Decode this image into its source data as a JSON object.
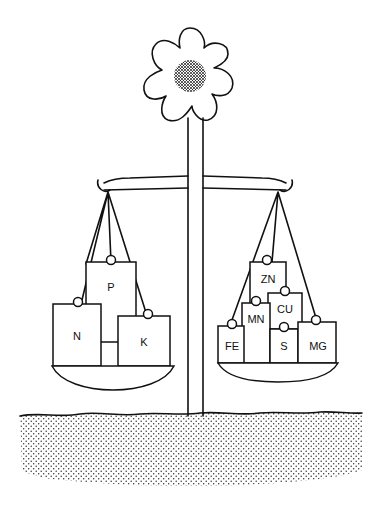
{
  "figure": {
    "colors": {
      "ink": "#111111",
      "paper": "#ffffff",
      "soil_dots": "#333333"
    },
    "left_pan": {
      "group": "macronutrients",
      "blocks": [
        {
          "label": "N"
        },
        {
          "label": "P"
        },
        {
          "label": "K"
        }
      ]
    },
    "right_pan": {
      "group": "micronutrients",
      "blocks": [
        {
          "label": "ZN"
        },
        {
          "label": "MN"
        },
        {
          "label": "CU"
        },
        {
          "label": "FE"
        },
        {
          "label": "S"
        },
        {
          "label": "MG"
        }
      ]
    }
  }
}
